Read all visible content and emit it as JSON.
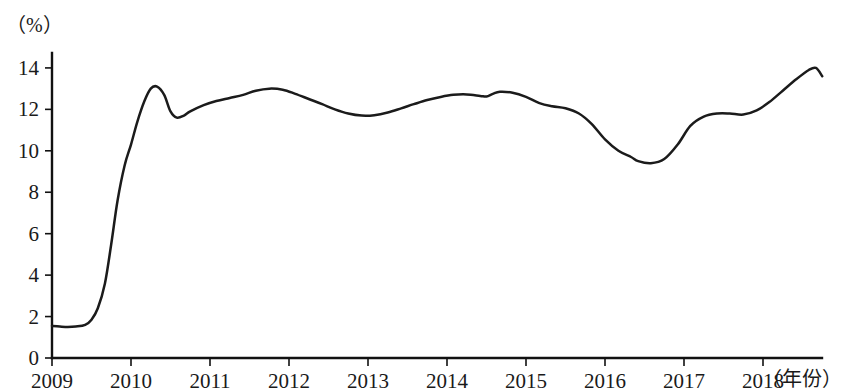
{
  "chart_data": {
    "type": "line",
    "title": "",
    "subtitle": "",
    "xlabel": "（年份）",
    "ylabel": "（%）",
    "xlim": [
      2009,
      2018.75
    ],
    "ylim": [
      0,
      15
    ],
    "grid": false,
    "legend": "none",
    "x_tick_labels": [
      "2009",
      "2010",
      "2011",
      "2012",
      "2013",
      "2014",
      "2015",
      "2016",
      "2017",
      "2018"
    ],
    "x_ticks": [
      2009,
      2010,
      2011,
      2012,
      2013,
      2014,
      2015,
      2016,
      2017,
      2018
    ],
    "y_tick_labels": [
      "0",
      "2",
      "4",
      "6",
      "8",
      "10",
      "12",
      "14"
    ],
    "y_ticks": [
      0,
      2,
      4,
      6,
      8,
      10,
      12,
      14
    ],
    "series": [
      {
        "name": "",
        "x": [
          2009.0,
          2009.1,
          2009.2,
          2009.3,
          2009.42,
          2009.5,
          2009.58,
          2009.67,
          2009.75,
          2009.83,
          2009.92,
          2010.0,
          2010.08,
          2010.17,
          2010.25,
          2010.33,
          2010.42,
          2010.5,
          2010.58,
          2010.67,
          2010.75,
          2010.92,
          2011.08,
          2011.25,
          2011.42,
          2011.58,
          2011.75,
          2011.92,
          2012.08,
          2012.25,
          2012.42,
          2012.58,
          2012.75,
          2012.92,
          2013.08,
          2013.25,
          2013.42,
          2013.58,
          2013.75,
          2013.92,
          2014.08,
          2014.25,
          2014.42,
          2014.5,
          2014.58,
          2014.67,
          2014.83,
          2015.0,
          2015.17,
          2015.33,
          2015.5,
          2015.67,
          2015.83,
          2016.0,
          2016.17,
          2016.33,
          2016.42,
          2016.58,
          2016.75,
          2016.92,
          2017.08,
          2017.25,
          2017.42,
          2017.58,
          2017.75,
          2017.92,
          2018.08,
          2018.25,
          2018.42,
          2018.58,
          2018.67,
          2018.75
        ],
        "values": [
          1.55,
          1.52,
          1.5,
          1.52,
          1.6,
          1.85,
          2.4,
          3.6,
          5.5,
          7.6,
          9.3,
          10.3,
          11.4,
          12.4,
          13.0,
          13.1,
          12.7,
          11.9,
          11.6,
          11.7,
          11.9,
          12.2,
          12.4,
          12.55,
          12.7,
          12.9,
          13.0,
          12.95,
          12.75,
          12.5,
          12.25,
          12.0,
          11.8,
          11.7,
          11.72,
          11.85,
          12.05,
          12.25,
          12.45,
          12.6,
          12.7,
          12.72,
          12.65,
          12.62,
          12.75,
          12.85,
          12.8,
          12.6,
          12.3,
          12.15,
          12.05,
          11.8,
          11.3,
          10.55,
          10.0,
          9.7,
          9.5,
          9.4,
          9.6,
          10.3,
          11.2,
          11.65,
          11.8,
          11.8,
          11.75,
          11.95,
          12.35,
          12.9,
          13.45,
          13.9,
          14.0,
          13.6
        ]
      }
    ]
  },
  "geometry": {
    "plot_left": 52,
    "plot_right": 822,
    "y_zero_px": 358,
    "y_top_px": 53,
    "y_top_value": 14.72,
    "x_per_year": 79
  }
}
